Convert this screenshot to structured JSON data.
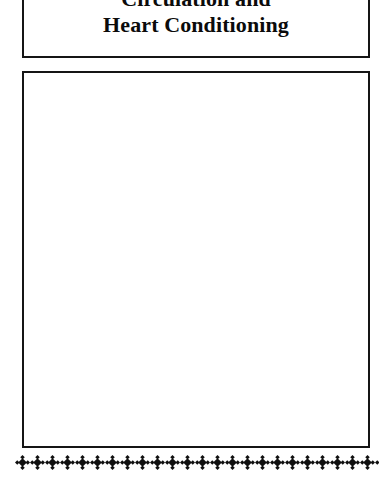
{
  "page": {
    "background_color": "#ffffff",
    "ink_color": "#101010",
    "width": 391,
    "height": 477
  },
  "title_box": {
    "name": "chapter-title-box",
    "border_color": "#151515",
    "clipped_at_top": true,
    "lines": [
      "Circulation and",
      "Heart Conditioning"
    ]
  },
  "content_box": {
    "name": "empty-content-box",
    "border_color": "#151515",
    "fill_color": "#ffffff",
    "text": ""
  },
  "ornament_band": {
    "name": "quatrefoil-border",
    "motif_icon": "quatrefoil-diamond-icon",
    "motif_glyph": "❖",
    "motif_color": "#101010",
    "motif_count": 30
  }
}
